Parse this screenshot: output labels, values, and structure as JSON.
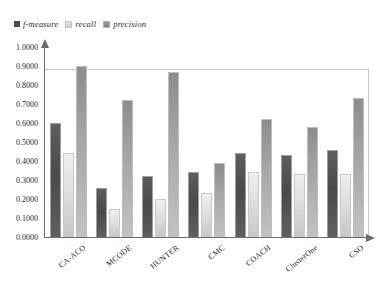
{
  "chart_data": {
    "type": "bar",
    "title": "",
    "xlabel": "",
    "ylabel": "",
    "ylim": [
      0.0,
      1.0
    ],
    "grid": false,
    "legend_position": "top-left",
    "categories": [
      "CA-ACO",
      "MCODE",
      "HUNTER",
      "CMC",
      "COACH",
      "ClusterOne",
      "CSO"
    ],
    "ytick_labels": [
      "1.0000",
      "0.9000",
      "0.8000",
      "0.7000",
      "0.6000",
      "0.5000",
      "0.4000",
      "0.3000",
      "0.2000",
      "0.1000",
      "0.0000"
    ],
    "ytick_values": [
      1.0,
      0.9,
      0.8,
      0.7,
      0.6,
      0.5,
      0.4,
      0.3,
      0.2,
      0.1,
      0.0
    ],
    "series": [
      {
        "name": "f-measure",
        "color": "#4d4d4d",
        "values": [
          0.6,
          0.26,
          0.32,
          0.34,
          0.44,
          0.43,
          0.46
        ]
      },
      {
        "name": "recall",
        "color": "#dcdcdc",
        "values": [
          0.44,
          0.15,
          0.2,
          0.23,
          0.34,
          0.33,
          0.33
        ]
      },
      {
        "name": "precision",
        "color": "#a5a5a5",
        "values": [
          0.9,
          0.72,
          0.87,
          0.39,
          0.62,
          0.58,
          0.73
        ]
      }
    ]
  },
  "legend": {
    "items": [
      {
        "label": "f-measure"
      },
      {
        "label": "recall"
      },
      {
        "label": "precision"
      }
    ]
  }
}
